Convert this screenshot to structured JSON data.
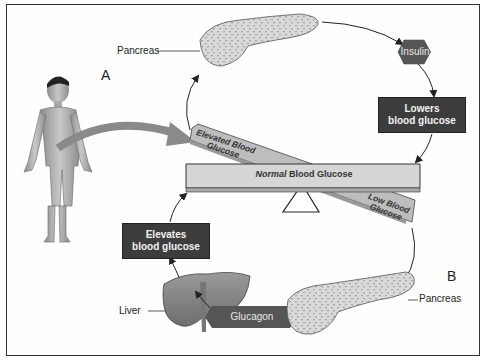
{
  "diagram": {
    "panel_labels": {
      "a": "A",
      "b": "B"
    },
    "organs": {
      "pancreas_top": "Pancreas",
      "pancreas_bottom": "Pancreas",
      "liver": "Liver"
    },
    "hormones": {
      "insulin": "Insulin",
      "glucagon": "Glucagon"
    },
    "effects": {
      "lowers_line1": "Lowers",
      "lowers_line2": "blood glucose",
      "elevates_line1": "Elevates",
      "elevates_line2": "blood glucose"
    },
    "seesaw": {
      "elevated_line1": "Elevated Blood",
      "elevated_line2": "Glucose",
      "normal_em": "Normal",
      "normal_rest": " Blood Glucose",
      "low_line1": "Low Blood",
      "low_line2": "Glucose"
    },
    "colors": {
      "box_fill": "#3d3d3d",
      "hex_fill": "#555555",
      "beam_fill": "#d6d6d6",
      "tilted_beam_fill": "#bdbdbd",
      "arrow_gray": "#8a8a8a"
    }
  }
}
